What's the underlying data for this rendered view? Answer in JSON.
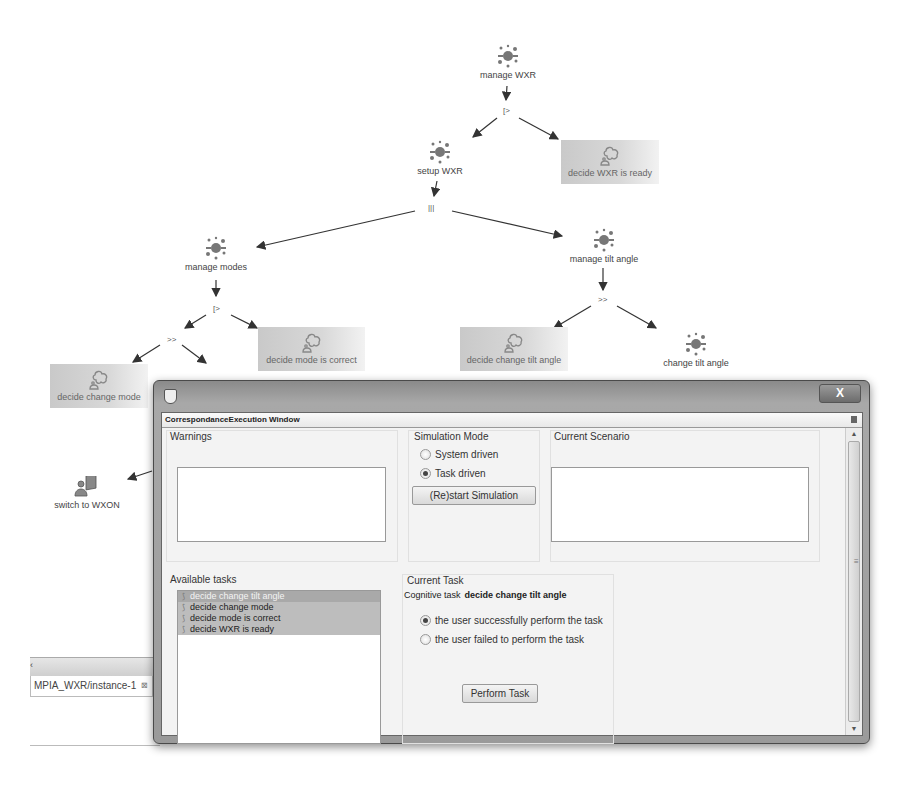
{
  "task_tree": {
    "nodes": [
      {
        "id": "manage_wxr",
        "label": "manage WXR",
        "type": "abstract"
      },
      {
        "id": "setup_wxr",
        "label": "setup WXR",
        "type": "abstract"
      },
      {
        "id": "decide_wxr_ready",
        "label": "decide WXR is ready",
        "type": "cognitive"
      },
      {
        "id": "manage_modes",
        "label": "manage modes",
        "type": "abstract"
      },
      {
        "id": "manage_tilt",
        "label": "manage tilt angle",
        "type": "abstract"
      },
      {
        "id": "decide_mode_correct",
        "label": "decide mode is correct",
        "type": "cognitive"
      },
      {
        "id": "decide_change_mode",
        "label": "decide change mode",
        "type": "cognitive"
      },
      {
        "id": "decide_change_tilt",
        "label": "decide change tilt angle",
        "type": "cognitive"
      },
      {
        "id": "change_tilt",
        "label": "change tilt angle",
        "type": "abstract"
      },
      {
        "id": "switch_wxon",
        "label": "switch to WXON",
        "type": "interaction"
      }
    ],
    "operators": {
      "op1": "[>",
      "op2": "|||",
      "op3": "[>",
      "op4": ">>",
      "op5": ">>"
    }
  },
  "background": {
    "tab_label": "MPIA_WXR/instance-1",
    "tab_close": "⊠",
    "caret": "‹"
  },
  "window": {
    "close_label": "X",
    "view_title": "CorrespondanceExecution Window",
    "warnings": {
      "label": "Warnings"
    },
    "simulation_mode": {
      "label": "Simulation Mode",
      "options": [
        {
          "label": "System driven",
          "selected": false
        },
        {
          "label": "Task driven",
          "selected": true
        }
      ],
      "restart_button": "(Re)start Simulation"
    },
    "current_scenario": {
      "label": "Current Scenario"
    },
    "available_tasks": {
      "label": "Available tasks",
      "items": [
        {
          "label": "decide change tilt angle",
          "selected": true
        },
        {
          "label": "decide change mode",
          "selected": false
        },
        {
          "label": "decide mode is correct",
          "selected": false
        },
        {
          "label": "decide WXR is ready",
          "selected": false
        }
      ]
    },
    "current_task": {
      "label": "Current Task",
      "cognitive_prefix": "Cognitive task",
      "cognitive_task": "decide change tilt angle",
      "outcomes": [
        {
          "label": "the user successfully perform the task",
          "selected": true
        },
        {
          "label": "the user failed to perform the task",
          "selected": false
        }
      ],
      "perform_button": "Perform Task"
    },
    "scrollbar": {
      "up": "▲",
      "down": "▼",
      "grip": "≡"
    }
  }
}
